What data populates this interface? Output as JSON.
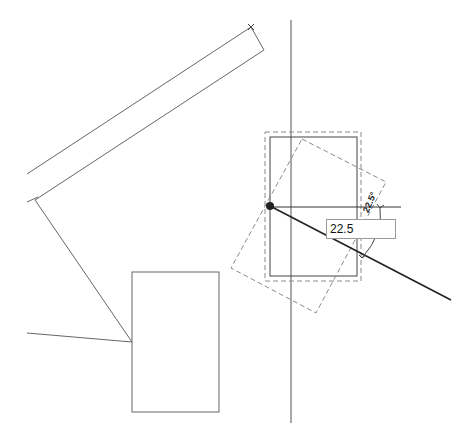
{
  "app": "CAD drawing canvas - rotate command",
  "colors": {
    "background": "#ffffff",
    "line": "#555555",
    "dashed_preview": "#8a8a8a",
    "active_line": "#222222",
    "snap_point": "#222222"
  },
  "dimension_input": {
    "value": "22.5"
  },
  "angle_label": "22.5°",
  "geometry": {
    "vertical_axis": {
      "x": 291,
      "y1": 20,
      "y2": 423
    },
    "reference_horizontal": {
      "x1": 270,
      "y1": 207,
      "x2": 401,
      "y2": 207
    },
    "rotation_ray": {
      "x1": 270,
      "y1": 206,
      "x2": 451,
      "y2": 300
    },
    "snap_point": {
      "cx": 270,
      "cy": 206,
      "r": 4
    },
    "selected_rect": {
      "x": 270,
      "y": 137,
      "w": 87,
      "h": 139
    },
    "selection_bbox_dashed": {
      "x": 265,
      "y": 132,
      "w": 96,
      "h": 149
    },
    "rotated_preview_dashed": [
      [
        302,
        139
      ],
      [
        386,
        182
      ],
      [
        316,
        313
      ],
      [
        231,
        268
      ]
    ],
    "wall_upper": {
      "x1": 27,
      "y1": 174,
      "x2": 251,
      "y2": 27
    },
    "wall_lower": {
      "x1": 35,
      "y1": 200,
      "x2": 264,
      "y2": 50
    },
    "wall_end_cap": {
      "x1": 251,
      "y1": 27,
      "x2": 264,
      "y2": 50
    },
    "diagonal_to_rect": {
      "x1": 35,
      "y1": 200,
      "x2": 132,
      "y2": 342
    },
    "left_line": {
      "x1": 27,
      "y1": 333,
      "x2": 132,
      "y2": 342
    },
    "lower_rect": {
      "x": 132,
      "y": 272,
      "w": 87,
      "h": 140
    },
    "angle_arc": {
      "x1": 380,
      "y1": 208,
      "x2": 362,
      "y2": 258
    }
  }
}
